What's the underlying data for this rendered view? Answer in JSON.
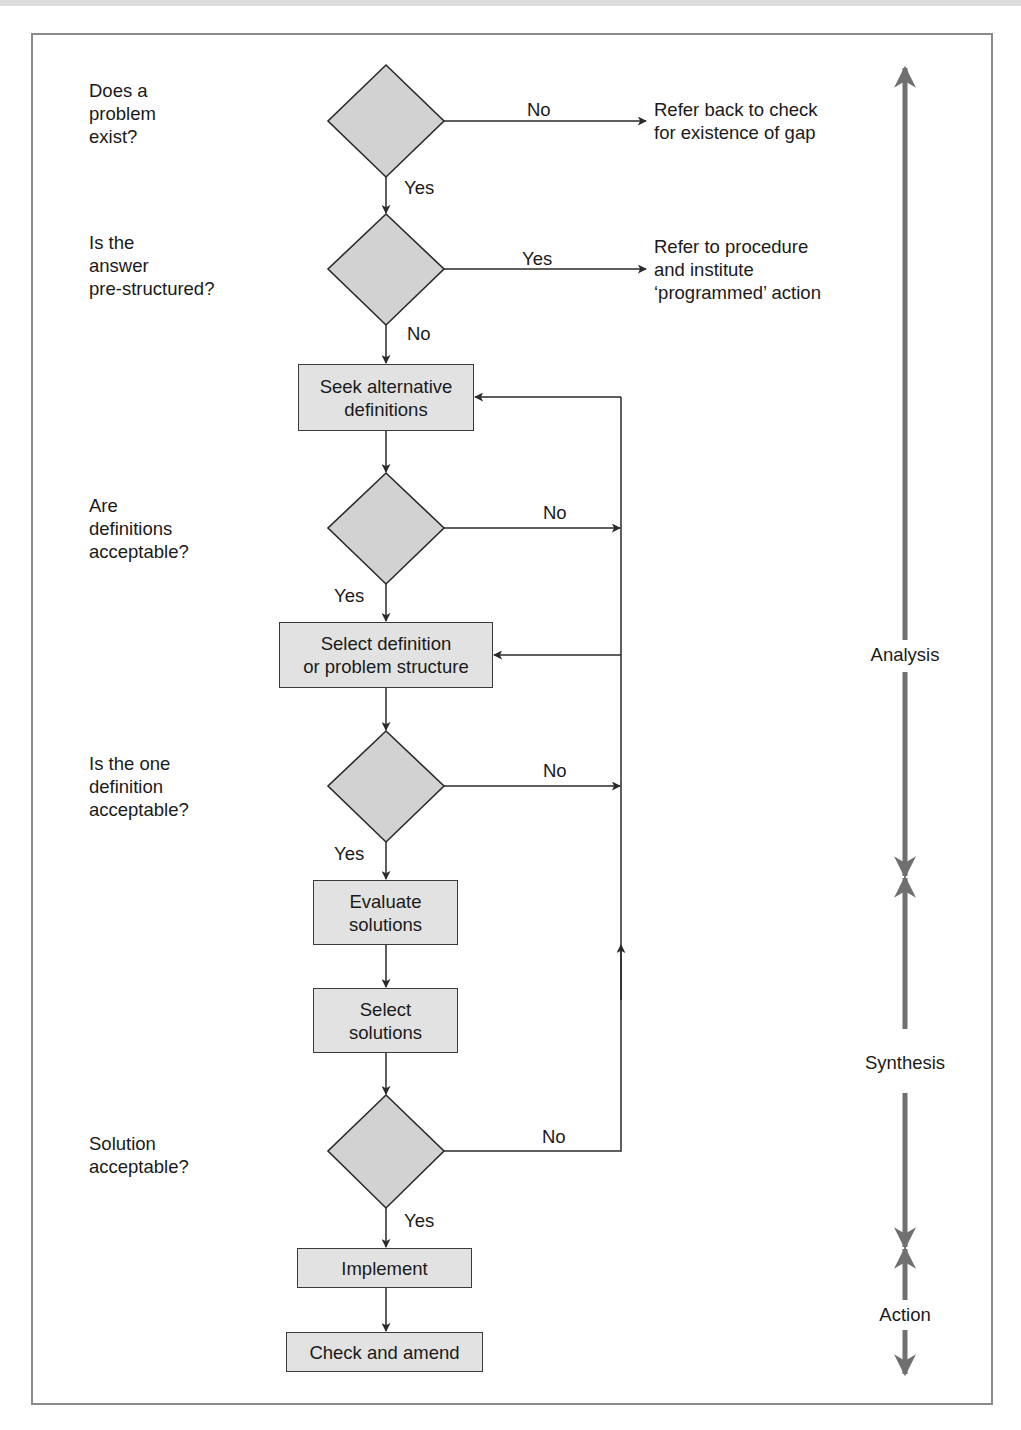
{
  "colors": {
    "shape_fill": "#e2e2e2",
    "diamond_fill": "#d2d2d2",
    "line": "#2a2a2a",
    "phase_arrow": "#707070",
    "frame": "#8a8a8a"
  },
  "questions": [
    {
      "id": "q1",
      "text": "Does a\nproblem\nexist?"
    },
    {
      "id": "q2",
      "text": "Is the\nanswer\npre-structured?"
    },
    {
      "id": "q3",
      "text": "Are\ndefinitions\nacceptable?"
    },
    {
      "id": "q4",
      "text": "Is the one\ndefinition\nacceptable?"
    },
    {
      "id": "q5",
      "text": "Solution\nacceptable?"
    }
  ],
  "side_notes": [
    {
      "id": "n1",
      "text": "Refer back to check\nfor existence of gap"
    },
    {
      "id": "n2",
      "text": "Refer to procedure\nand institute\n‘programmed’ action"
    }
  ],
  "process_boxes": [
    {
      "id": "b1",
      "text": "Seek alternative\ndefinitions"
    },
    {
      "id": "b2",
      "text": "Select definition\nor problem structure"
    },
    {
      "id": "b3",
      "text": "Evaluate\nsolutions"
    },
    {
      "id": "b4",
      "text": "Select\nsolutions"
    },
    {
      "id": "b5",
      "text": "Implement"
    },
    {
      "id": "b6",
      "text": "Check and amend"
    }
  ],
  "edge_labels": {
    "d1_right": "No",
    "d1_down": "Yes",
    "d2_right": "Yes",
    "d2_down": "No",
    "d3_right": "No",
    "d3_down": "Yes",
    "d4_right": "No",
    "d4_down": "Yes",
    "d5_right": "No",
    "d5_down": "Yes"
  },
  "phases": [
    {
      "id": "analysis",
      "label": "Analysis"
    },
    {
      "id": "synthesis",
      "label": "Synthesis"
    },
    {
      "id": "action",
      "label": "Action"
    }
  ]
}
